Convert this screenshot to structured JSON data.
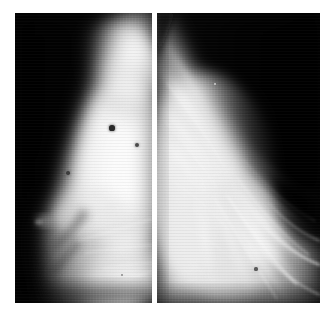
{
  "figure": {
    "kind": "medical-image-pair",
    "modality": "mammogram",
    "background_color": "#ffffff",
    "width": 333,
    "height": 319,
    "caption": "",
    "title": ""
  },
  "panels": [
    {
      "id": "panel-left",
      "name": "left-mammogram-panel",
      "view_label": "",
      "x": 15,
      "y": 13,
      "width": 137,
      "height": 290,
      "border_color": "#ffffff",
      "background_color": "#000000",
      "tissue_color": "#f2f2f2",
      "description": "Mediolateral mammogram with dense fibroglandular tissue occupying the right two thirds of the frame, dark air background wedge at upper left, skin line and nipple in profile at left margin",
      "breast_edge_top_x_pct": 52,
      "breast_edge_bottom_x_pct": 16,
      "markers": [
        {
          "name": "calcification-marker-1",
          "x": 112,
          "y": 128,
          "radius": 2.6,
          "color": "#2a2a2a"
        },
        {
          "name": "calcification-marker-2",
          "x": 137,
          "y": 145,
          "radius": 2.0,
          "color": "#4a4a4a"
        },
        {
          "name": "calcification-marker-3",
          "x": 68,
          "y": 173,
          "radius": 1.8,
          "color": "#3d3d3d"
        },
        {
          "name": "calcification-marker-4",
          "x": 122,
          "y": 275,
          "radius": 1.4,
          "color": "#8a8a8a"
        }
      ]
    },
    {
      "id": "panel-right",
      "name": "right-mammogram-panel",
      "view_label": "",
      "x": 157,
      "y": 13,
      "width": 163,
      "height": 290,
      "border_color": "#ffffff",
      "background_color": "#000000",
      "tissue_color": "#e8e8e8",
      "description": "Mediolateral mammogram showing radiating linear fibroglandular strands fanning from lower right toward upper left, dark air background wedge at upper right, trabecular bands crossing the lower third",
      "breast_edge_top_x_pct": 10,
      "breast_edge_bottom_x_pct": 95,
      "markers": [
        {
          "name": "tissue-marker-1",
          "x": 256,
          "y": 269,
          "radius": 1.6,
          "color": "#5a5a5a"
        },
        {
          "name": "tissue-marker-2",
          "x": 215,
          "y": 84,
          "radius": 1.2,
          "color": "#cfcfcf"
        }
      ]
    }
  ],
  "gap": {
    "name": "panel-gap",
    "x": 152,
    "width": 5,
    "color": "#ffffff"
  }
}
